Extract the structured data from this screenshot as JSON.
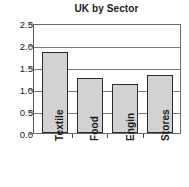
{
  "chart_data": {
    "type": "bar",
    "title": "UK by Sector",
    "xlabel": "",
    "ylabel": "",
    "categories": [
      "Textile",
      "Food",
      "Engin",
      "Stores"
    ],
    "values": [
      1.85,
      1.25,
      1.12,
      1.32
    ],
    "ylim": [
      0.0,
      2.5
    ],
    "ytick_labels": [
      "0.0",
      "0.5",
      "1.0",
      "1.5",
      "2.0",
      "2.5"
    ],
    "ytick_values": [
      0.0,
      0.5,
      1.0,
      1.5,
      2.0,
      2.5
    ],
    "grid": true,
    "grid_axis": "y",
    "legend": false,
    "legend_position": "none",
    "bar_fill_color": "#d2d2d2",
    "bar_edge_color": "#2b2b2b",
    "axis_color": "#6b6b6b",
    "grid_color": "#7a7a7a",
    "text_color": "#1a1a1a",
    "background_color": "#ffffff",
    "xtick_label_rotation": 90
  }
}
